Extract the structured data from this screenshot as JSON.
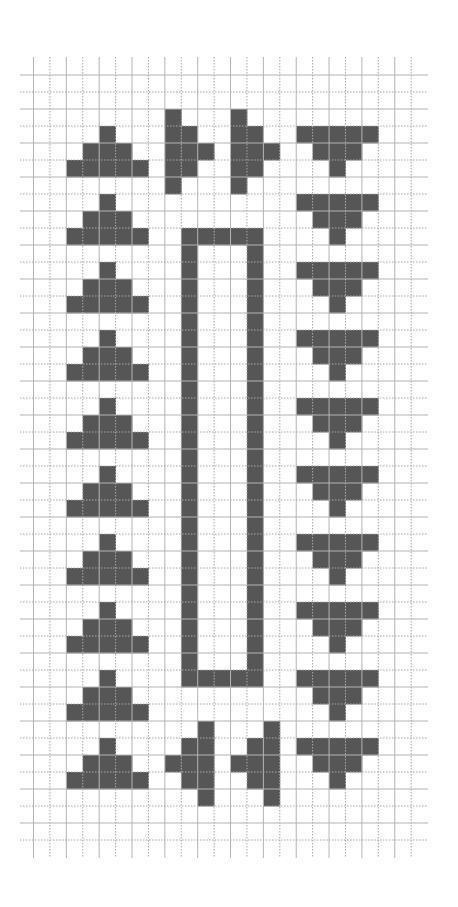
{
  "pattern_chart": {
    "type": "pixel-grid",
    "columns": 23,
    "rows_count": 45,
    "colors": {
      "background": "#ffffff",
      "filled_cell": "#565656",
      "grid_line": "#b4b4b4"
    },
    "geometry": {
      "origin_x": 33.5,
      "origin_y": 75,
      "cell_width": 16.42,
      "cell_height": 17.0,
      "vertical_line_top": 57,
      "vertical_line_bottom": 858,
      "horizontal_line_left": 20,
      "horizontal_line_right": 428
    },
    "legend": {
      "filled": "#",
      "empty": "."
    },
    "motifs": [
      {
        "name": "up-triangle",
        "count": 10,
        "columns": "2-6",
        "apex_rows": [
          3,
          7,
          11,
          15,
          19,
          23,
          27,
          31,
          35,
          39
        ]
      },
      {
        "name": "down-triangle",
        "count": 10,
        "columns": "16-20",
        "top_rows": [
          3,
          7,
          11,
          15,
          19,
          23,
          27,
          31,
          35,
          39
        ]
      },
      {
        "name": "right-arrow",
        "count": 2,
        "tip_columns": [
          10,
          14
        ],
        "rows": "2-6"
      },
      {
        "name": "left-arrow",
        "count": 2,
        "tip_columns": [
          8,
          12
        ],
        "rows": "38-42"
      },
      {
        "name": "rectangle-outline",
        "count": 1,
        "columns": "9-13",
        "rows": "9-35"
      }
    ],
    "grid_rows": [
      ".......................",
      ".......................",
      "........#...#..........",
      "....#...##..##..#####..",
      "...###..###.###..###...",
      "..#####.##..##....#....",
      "........#...#..........",
      "....#...........#####..",
      "...###...........###...",
      "..#####..#####....#....",
      ".........#...#.........",
      "....#....#...#..#####..",
      "...###...#...#...###...",
      "..#####..#...#....#....",
      ".........#...#.........",
      "....#....#...#..#####..",
      "...###...#...#...###...",
      "..#####..#...#....#....",
      ".........#...#.........",
      "....#....#...#..#####..",
      "...###...#...#...###...",
      "..#####..#...#....#....",
      ".........#...#.........",
      "....#....#...#..#####..",
      "...###...#...#...###...",
      "..#####..#...#....#....",
      ".........#...#.........",
      "....#....#...#..#####..",
      "...###...#...#...###...",
      "..#####..#...#....#....",
      ".........#...#.........",
      "....#....#...#..#####..",
      "...###...#...#...###...",
      "..#####..#...#....#....",
      ".........#...#.........",
      "....#....#####..#####..",
      "...###...........###...",
      "..#####...........#....",
      "..........#...#........",
      "....#....##..##.#####..",
      "...###..###.###..###...",
      "..#####..##..##...#....",
      "..........#...#........",
      ".......................",
      "......................."
    ]
  }
}
